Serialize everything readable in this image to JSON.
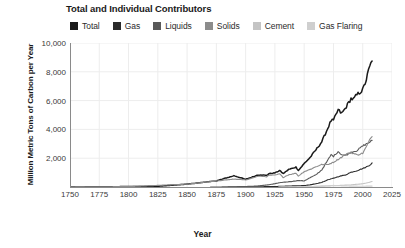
{
  "chart_data": {
    "type": "line",
    "title": "Total and Individual Contributors",
    "xlabel": "Year",
    "ylabel": "Million Metric Tons of Carbon per Year",
    "xlim": [
      1750,
      2025
    ],
    "ylim": [
      0,
      10000
    ],
    "grid": true,
    "legend_position": "top",
    "xticks": [
      "1750",
      "1775",
      "1800",
      "1825",
      "1850",
      "1875",
      "1900",
      "1925",
      "1950",
      "1975",
      "2000",
      "2025"
    ],
    "yticks": [
      "2,000",
      "4,000",
      "6,000",
      "8,000",
      "10,000"
    ],
    "series": [
      {
        "name": "Total",
        "color": "#1a1a1a",
        "x": [
          1751,
          1775,
          1800,
          1825,
          1850,
          1875,
          1890,
          1900,
          1910,
          1913,
          1918,
          1920,
          1925,
          1929,
          1932,
          1937,
          1940,
          1943,
          1945,
          1946,
          1950,
          1955,
          1960,
          1965,
          1970,
          1973,
          1975,
          1979,
          1982,
          1985,
          1990,
          1992,
          1995,
          2000,
          2003,
          2005,
          2007,
          2008
        ],
        "values": [
          3,
          15,
          30,
          50,
          198,
          426,
          784,
          534,
          819,
          843,
          806,
          932,
          975,
          1145,
          929,
          1229,
          1299,
          1379,
          1160,
          1238,
          1630,
          2043,
          2577,
          3136,
          4053,
          4615,
          4615,
          5350,
          5107,
          5442,
          6143,
          6085,
          6395,
          6754,
          7431,
          8094,
          8574,
          8749
        ],
        "ylabel_units": "Million Metric Tons of Carbon per Year"
      },
      {
        "name": "Gas",
        "color": "#2a2a2a",
        "x": [
          1885,
          1900,
          1910,
          1920,
          1930,
          1940,
          1950,
          1955,
          1960,
          1965,
          1970,
          1975,
          1980,
          1985,
          1990,
          1995,
          2000,
          2005,
          2008
        ],
        "values": [
          1,
          9,
          18,
          27,
          45,
          75,
          97,
          150,
          227,
          321,
          493,
          610,
          740,
          832,
          1026,
          1130,
          1280,
          1463,
          1672
        ]
      },
      {
        "name": "Liquids",
        "color": "#595959",
        "x": [
          1870,
          1890,
          1900,
          1910,
          1920,
          1930,
          1940,
          1945,
          1950,
          1955,
          1960,
          1965,
          1970,
          1973,
          1975,
          1979,
          1982,
          1985,
          1990,
          1995,
          2000,
          2005,
          2008
        ],
        "values": [
          1,
          10,
          35,
          70,
          154,
          310,
          390,
          450,
          423,
          640,
          849,
          1185,
          1838,
          2240,
          2131,
          2467,
          2251,
          2186,
          2420,
          2530,
          2844,
          3072,
          3237
        ]
      },
      {
        "name": "Solids",
        "color": "#8c8c8c",
        "x": [
          1751,
          1800,
          1850,
          1875,
          1890,
          1900,
          1910,
          1913,
          1918,
          1920,
          1925,
          1929,
          1932,
          1937,
          1940,
          1943,
          1945,
          1950,
          1955,
          1960,
          1965,
          1970,
          1975,
          1980,
          1985,
          1990,
          1995,
          2000,
          2003,
          2005,
          2007,
          2008
        ],
        "values": [
          3,
          30,
          197,
          415,
          550,
          490,
          731,
          753,
          714,
          812,
          822,
          915,
          660,
          860,
          900,
          960,
          760,
          1070,
          1220,
          1410,
          1560,
          1560,
          1720,
          1970,
          2240,
          2400,
          2230,
          2340,
          2780,
          3100,
          3410,
          3500
        ]
      },
      {
        "name": "Cement",
        "color": "#c4c4c4",
        "x": [
          1928,
          1940,
          1950,
          1960,
          1970,
          1980,
          1990,
          2000,
          2005,
          2008
        ],
        "values": [
          5,
          12,
          18,
          43,
          72,
          108,
          148,
          226,
          310,
          385
        ]
      },
      {
        "name": "Gas Flaring",
        "color": "#cfcfcf",
        "x": [
          1950,
          1960,
          1970,
          1975,
          1980,
          1990,
          2000,
          2008
        ],
        "values": [
          23,
          41,
          87,
          110,
          85,
          60,
          55,
          62
        ]
      }
    ]
  },
  "legend": {
    "items": [
      {
        "label": "Total",
        "color": "#1a1a1a"
      },
      {
        "label": "Gas",
        "color": "#2a2a2a"
      },
      {
        "label": "Liquids",
        "color": "#595959"
      },
      {
        "label": "Solids",
        "color": "#8c8c8c"
      },
      {
        "label": "Cement",
        "color": "#c4c4c4"
      },
      {
        "label": "Gas Flaring",
        "color": "#cfcfcf"
      }
    ]
  }
}
